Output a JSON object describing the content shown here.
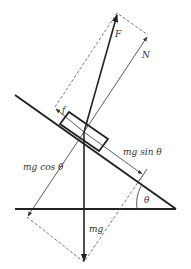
{
  "diagram": {
    "type": "free-body diagram on inclined plane",
    "labels": {
      "F": "F",
      "N": "N",
      "f": "f",
      "mg_sin": "mg sin θ",
      "mg_cos": "mg cos θ",
      "mg": "mg",
      "theta": "θ"
    },
    "colors": {
      "line": "#222222",
      "dashed": "#555555",
      "text": "#333333",
      "background": "#ffffff"
    }
  }
}
